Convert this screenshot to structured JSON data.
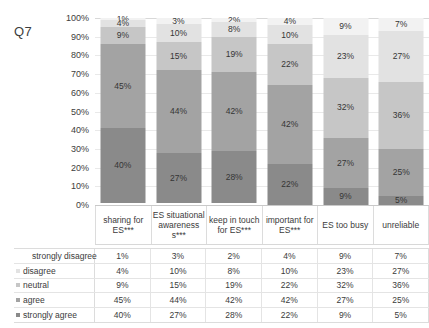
{
  "title": "Q7",
  "chart_data": {
    "type": "bar",
    "title": "Q7",
    "xlabel": "",
    "ylabel": "",
    "ylim": [
      0,
      100
    ],
    "grid": true,
    "stacked": true,
    "legend_position": "left-table",
    "ytick_labels": [
      "100%",
      "90%",
      "80%",
      "70%",
      "60%",
      "50%",
      "40%",
      "30%",
      "20%",
      "10%",
      "0%"
    ],
    "categories": [
      "sharing for ES***",
      "ES situational awareness s***",
      "keep in touch for ES***",
      "important for ES***",
      "ES too busy",
      "unreliable"
    ],
    "series": [
      {
        "name": "strongly disagree",
        "color": "#f2f2f2",
        "values": [
          1,
          3,
          2,
          4,
          9,
          7
        ],
        "labels": [
          "1%",
          "3%",
          "2%",
          "4%",
          "9%",
          "7%"
        ]
      },
      {
        "name": "disagree",
        "color": "#e2e2e2",
        "values": [
          4,
          10,
          8,
          10,
          23,
          27
        ],
        "labels": [
          "4%",
          "10%",
          "8%",
          "10%",
          "23%",
          "27%"
        ]
      },
      {
        "name": "neutral",
        "color": "#c6c6c6",
        "values": [
          9,
          15,
          19,
          22,
          32,
          36
        ],
        "labels": [
          "9%",
          "15%",
          "19%",
          "22%",
          "32%",
          "36%"
        ]
      },
      {
        "name": "agree",
        "color": "#a3a3a3",
        "values": [
          45,
          44,
          42,
          42,
          27,
          25
        ],
        "labels": [
          "45%",
          "44%",
          "42%",
          "42%",
          "27%",
          "25%"
        ]
      },
      {
        "name": "strongly agree",
        "color": "#8a8a8a",
        "values": [
          40,
          27,
          28,
          22,
          9,
          5
        ],
        "labels": [
          "40%",
          "27%",
          "28%",
          "22%",
          "9%",
          "5%"
        ]
      }
    ]
  },
  "table": {
    "rows": [
      {
        "label": "strongly disagree",
        "swatch": "#f2f2f2",
        "show_swatch": false,
        "values": [
          "1%",
          "3%",
          "2%",
          "4%",
          "9%",
          "7%"
        ]
      },
      {
        "label": "disagree",
        "swatch": "#e2e2e2",
        "show_swatch": true,
        "values": [
          "4%",
          "10%",
          "8%",
          "10%",
          "23%",
          "27%"
        ]
      },
      {
        "label": "neutral",
        "swatch": "#c6c6c6",
        "show_swatch": true,
        "values": [
          "9%",
          "15%",
          "19%",
          "22%",
          "32%",
          "36%"
        ]
      },
      {
        "label": "agree",
        "swatch": "#a3a3a3",
        "show_swatch": true,
        "values": [
          "45%",
          "44%",
          "42%",
          "42%",
          "27%",
          "25%"
        ]
      },
      {
        "label": "strongly agree",
        "swatch": "#8a8a8a",
        "show_swatch": true,
        "values": [
          "40%",
          "27%",
          "28%",
          "22%",
          "9%",
          "5%"
        ]
      }
    ]
  }
}
